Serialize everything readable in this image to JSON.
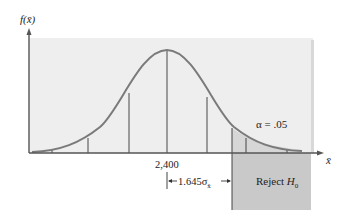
{
  "diagram": {
    "title": "",
    "y_axis_label": "f(x̄)",
    "x_axis_label": "x̄",
    "mean_label": "2,400",
    "critical_distance_label": "1.645σ",
    "critical_distance_subscript": "x̄",
    "reject_region_label": "Reject H",
    "reject_region_subscript": "0",
    "alpha_label": "α = .05",
    "colors": {
      "background_panel": "#eeeeee",
      "reject_region": "#c8c8c8",
      "curve": "#7a7a7a",
      "axis": "#555555",
      "lines": "#333333"
    }
  }
}
